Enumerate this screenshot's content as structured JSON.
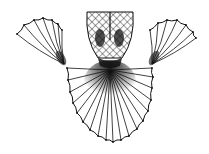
{
  "figure": {
    "background": "#ffffff",
    "ink": "#111111",
    "bulb": {
      "cx": 110,
      "top": 12,
      "bottom": 62,
      "halfWidth": 24
    },
    "leftFan": {
      "origin": [
        64,
        64
      ],
      "tips": [
        [
          17,
          34
        ],
        [
          24,
          25
        ],
        [
          34,
          20
        ],
        [
          43,
          18
        ],
        [
          52,
          20
        ],
        [
          58,
          24
        ],
        [
          62,
          30
        ]
      ]
    },
    "rightFan": {
      "origin": [
        152,
        64
      ],
      "tips": [
        [
          150,
          30
        ],
        [
          158,
          23
        ],
        [
          167,
          20
        ],
        [
          177,
          20
        ],
        [
          186,
          25
        ],
        [
          193,
          32
        ],
        [
          196,
          38
        ]
      ]
    },
    "lowerFan": {
      "origin": [
        110,
        70
      ],
      "edge": [
        [
          67,
          68
        ],
        [
          68,
          80
        ],
        [
          70,
          92
        ],
        [
          73,
          103
        ],
        [
          77,
          113
        ],
        [
          83,
          122
        ],
        [
          90,
          130
        ],
        [
          98,
          136
        ],
        [
          106,
          140
        ],
        [
          113,
          142
        ],
        [
          121,
          140
        ],
        [
          129,
          136
        ],
        [
          137,
          129
        ],
        [
          143,
          121
        ],
        [
          148,
          111
        ],
        [
          151,
          100
        ],
        [
          152,
          88
        ],
        [
          153,
          77
        ],
        [
          152,
          68
        ]
      ]
    }
  }
}
